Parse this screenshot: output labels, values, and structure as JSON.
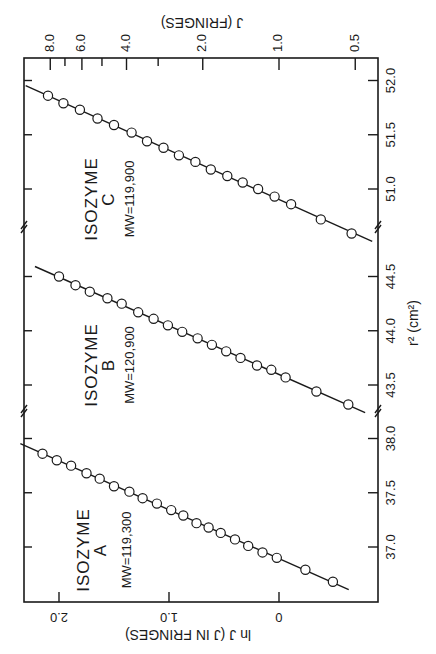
{
  "chart_data": {
    "type": "scatter",
    "orientation": "figure rotated 90 degrees; r2 axis runs along right edge (increasing upward), ln J axis along bottom edge (increasing leftward)",
    "title": "",
    "xlabel": "r² (cm²)",
    "ylabel": "ln J (J IN FRINGES)",
    "secondary_ylabel": "J (FRINGES)",
    "ylim": [
      -0.8,
      2.3
    ],
    "x_axis_broken": true,
    "x_segments": [
      {
        "range": [
          36.6,
          38.05
        ],
        "ticks": [
          "37.0",
          "37.5",
          "38.0"
        ]
      },
      {
        "range": [
          43.25,
          44.55
        ],
        "ticks": [
          "43.5",
          "44.0",
          "44.5"
        ]
      },
      {
        "range": [
          50.55,
          52.1
        ],
        "ticks": [
          "51.0",
          "51.5",
          "52.0"
        ]
      }
    ],
    "y_ticks": [
      "2.0",
      "1.0",
      "0"
    ],
    "secondary_y_ticks": [
      "8.0",
      "6.0",
      "4.0",
      "2.0",
      "1.0",
      "0.5"
    ],
    "grid": false,
    "legend": null,
    "series": [
      {
        "name": "Isozyme A",
        "label_line1": "ISOZYME",
        "label_line2": "A",
        "label_mw": "MW=119,300",
        "x": [
          36.68,
          36.79,
          36.9,
          36.95,
          37.01,
          37.07,
          37.13,
          37.18,
          37.22,
          37.29,
          37.34,
          37.4,
          37.45,
          37.51,
          37.56,
          37.63,
          37.68,
          37.75,
          37.8,
          37.86
        ],
        "y": [
          -0.49,
          -0.24,
          0.02,
          0.15,
          0.28,
          0.4,
          0.53,
          0.64,
          0.75,
          0.87,
          0.98,
          1.11,
          1.24,
          1.36,
          1.5,
          1.63,
          1.75,
          1.89,
          2.02,
          2.15
        ]
      },
      {
        "name": "Isozyme B",
        "label_line1": "ISOZYME",
        "label_line2": "B",
        "label_mw": "MW=120,900",
        "x": [
          43.32,
          43.44,
          43.57,
          43.64,
          43.68,
          43.75,
          43.81,
          43.87,
          43.93,
          43.99,
          44.05,
          44.11,
          44.17,
          44.25,
          44.3,
          44.36,
          44.42,
          44.5
        ],
        "y": [
          -0.63,
          -0.34,
          -0.06,
          0.07,
          0.2,
          0.35,
          0.48,
          0.61,
          0.74,
          0.88,
          1.01,
          1.14,
          1.28,
          1.43,
          1.56,
          1.72,
          1.85,
          2.0
        ]
      },
      {
        "name": "Isozyme C",
        "label_line1": "ISOZYME",
        "label_line2": "C",
        "label_mw": "MW=119,900",
        "x": [
          50.59,
          50.72,
          50.86,
          50.93,
          51.0,
          51.06,
          51.12,
          51.18,
          51.25,
          51.31,
          51.38,
          51.44,
          51.52,
          51.59,
          51.65,
          51.73,
          51.79,
          51.86
        ],
        "y": [
          -0.66,
          -0.38,
          -0.11,
          0.04,
          0.19,
          0.33,
          0.47,
          0.62,
          0.76,
          0.91,
          1.05,
          1.2,
          1.34,
          1.5,
          1.65,
          1.81,
          1.96,
          2.1
        ]
      }
    ]
  },
  "labels": {
    "r2_axis": "r² (cm²)",
    "lnj_axis": "ln J  (J IN FRINGES)",
    "j_axis": "J  (FRINGES)"
  }
}
